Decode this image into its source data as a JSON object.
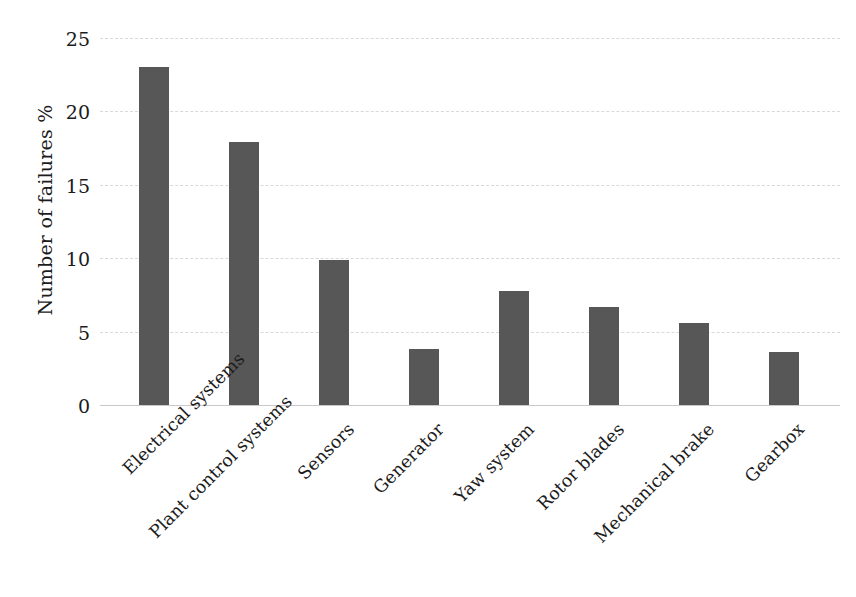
{
  "chart_data": {
    "type": "bar",
    "title": "",
    "subtitle": "",
    "xlabel": "",
    "ylabel": "Number of failures %",
    "ylim": [
      0,
      25
    ],
    "ytick_step": 5,
    "yticks": [
      "25",
      "20",
      "15",
      "10",
      "5",
      "0"
    ],
    "grid": "horizontal-dashed",
    "legend": "none",
    "bar_color": "#575757",
    "gridline_color": "#d9d9d9",
    "axis_color": "#c9c9c9",
    "label_rotation_deg": -45,
    "categories": [
      "Electrical systems",
      "Plant control systems",
      "Sensors",
      "Generator",
      "Yaw system",
      "Rotor blades",
      "Mechanical brake",
      "Gearbox"
    ],
    "values": [
      23.0,
      17.9,
      9.9,
      3.8,
      7.8,
      6.7,
      5.6,
      3.6
    ]
  }
}
